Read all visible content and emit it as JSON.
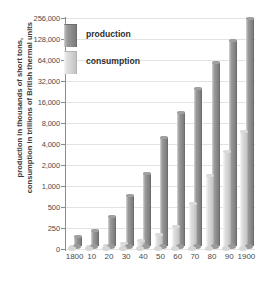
{
  "chart_data": {
    "type": "bar",
    "title": "",
    "xlabel": "",
    "ylabel": "production in thousands of short tons, consumption in trillions of British thermal units",
    "categories": [
      "1800",
      "10",
      "20",
      "30",
      "40",
      "50",
      "60",
      "70",
      "80",
      "90",
      "1900"
    ],
    "yticks": [
      "0",
      "250",
      "500",
      "1,000",
      "2,000",
      "4,000",
      "8,000",
      "16,000",
      "32,000",
      "64,000",
      "128,000",
      "256,000"
    ],
    "ytick_values": [
      0,
      250,
      500,
      1000,
      2000,
      4000,
      8000,
      16000,
      32000,
      64000,
      128000,
      256000
    ],
    "yscale": "log2-above-250",
    "ylim": [
      0,
      256000
    ],
    "grid": true,
    "legend_position": "upper-left-inside",
    "series": [
      {
        "name": "production",
        "color": "#8d8d8d",
        "values": [
          108,
          175,
          330,
          650,
          1345,
          4350,
          10000,
          22000,
          52000,
          110000,
          225000
        ]
      },
      {
        "name": "consumption",
        "color": "#d2d2d2",
        "values": [
          18,
          25,
          40,
          60,
          95,
          170,
          260,
          560,
          1380,
          3100,
          5900
        ]
      }
    ]
  },
  "legend": {
    "items": [
      {
        "label": "production",
        "swatch": "production-swatch"
      },
      {
        "label": "consumption",
        "swatch": "consumption-swatch"
      }
    ]
  },
  "axis": {
    "y_title_line1": "production in thousands of short tons,",
    "y_title_line2": "consumption in trillions of British thermal units"
  }
}
